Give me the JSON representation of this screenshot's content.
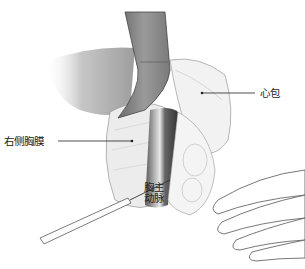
{
  "figure": {
    "type": "surgical-illustration",
    "labels": {
      "pericardium": "心包",
      "right_pleura": "右侧胸膜",
      "aorta_line1": "胸主",
      "aorta_line2": "动脉"
    },
    "colors": {
      "background": "#ffffff",
      "retractor": "#8a8a8a",
      "line": "#333333",
      "aorta_dark": "#3a3a3a"
    }
  }
}
